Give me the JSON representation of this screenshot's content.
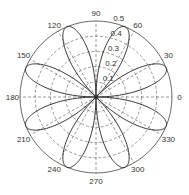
{
  "chart_data": {
    "type": "line",
    "subtype": "polar",
    "title": "",
    "function": "r = 0.5 * |sin(4θ)|",
    "petals": 8,
    "petal_peak_angles_deg": [
      22.5,
      67.5,
      112.5,
      157.5,
      202.5,
      247.5,
      292.5,
      337.5
    ],
    "petal_peak_r": 0.5,
    "rlim": [
      0,
      0.5
    ],
    "radial_ticks": [
      0.1,
      0.2,
      0.3,
      0.4,
      0.5
    ],
    "radial_tick_labels": [
      "0.1",
      "0.2",
      "0.3",
      "0.4",
      "0.5"
    ],
    "angular_ticks_deg": [
      0,
      30,
      60,
      90,
      120,
      150,
      180,
      210,
      240,
      270,
      300,
      330
    ],
    "angular_tick_labels": [
      "0",
      "30",
      "60",
      "90",
      "120",
      "150",
      "180",
      "210",
      "240",
      "270",
      "300",
      "330"
    ],
    "grid": true,
    "grid_style": "dashed",
    "series": [
      {
        "name": "rose",
        "theta_deg": [
          0,
          11.25,
          22.5,
          33.75,
          45,
          56.25,
          67.5,
          78.75,
          90,
          101.25,
          112.5,
          123.75,
          135,
          146.25,
          157.5,
          168.75,
          180,
          191.25,
          202.5,
          213.75,
          225,
          236.25,
          247.5,
          258.75,
          270,
          281.25,
          292.5,
          303.75,
          315,
          326.25,
          337.5,
          348.75,
          360
        ],
        "r": [
          0,
          0.354,
          0.5,
          0.354,
          0,
          0.354,
          0.5,
          0.354,
          0,
          0.354,
          0.5,
          0.354,
          0,
          0.354,
          0.5,
          0.354,
          0,
          0.354,
          0.5,
          0.354,
          0,
          0.354,
          0.5,
          0.354,
          0,
          0.354,
          0.5,
          0.354,
          0,
          0.354,
          0.5,
          0.354,
          0
        ]
      }
    ],
    "colors": {
      "curve": "#222222",
      "grid": "#555555",
      "outer_circle": "#444444",
      "text": "#333333"
    }
  }
}
